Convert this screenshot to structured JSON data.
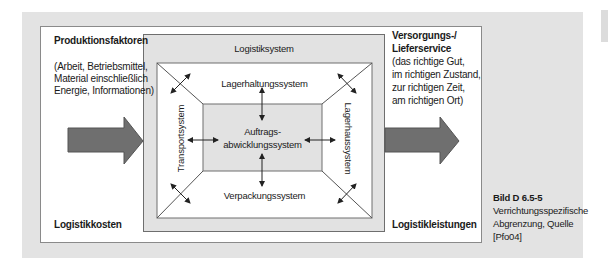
{
  "figure": {
    "left_block": {
      "title": "Produktionsfaktoren",
      "lines": [
        "(Arbeit, Betriebsmittel,",
        "Material einschließlich",
        "Energie, Informationen)"
      ],
      "bottom_label": "Logistikkosten"
    },
    "right_block": {
      "title_lines": [
        "Versorgungs-/",
        "Lieferservice"
      ],
      "lines": [
        "(das richtige Gut,",
        "im richtigen Zustand,",
        "zur richtigen Zeit,",
        "am richtigen Ort)"
      ],
      "bottom_label": "Logistikleistungen"
    },
    "system": {
      "title": "Logistiksystem",
      "top": "Lagerhaltungssystem",
      "bottom": "Verpackungssystem",
      "left": "Transportsystem",
      "right": "Lagerhaussystem",
      "center_lines": [
        "Auftrags-",
        "abwicklungssystem"
      ]
    },
    "colors": {
      "panel": "#e3e3e3",
      "arrow_fill": "#6f6f6f",
      "arrow_stroke": "#555555",
      "inner_gray": "#e2e2e2",
      "line": "#555555"
    }
  },
  "caption": {
    "label": "Bild D 6.5-5",
    "lines": [
      "Verrichtungsspezifische",
      "Abgrenzung, Quelle",
      "[Pfo04]"
    ]
  }
}
